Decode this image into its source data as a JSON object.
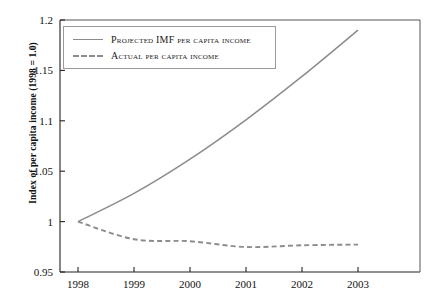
{
  "chart_data": {
    "type": "line",
    "title": "",
    "xlabel": "",
    "ylabel": "Index of per capita income (1998 = 1.0)",
    "x": [
      1998,
      1999,
      2000,
      2001,
      2002,
      2003
    ],
    "xtick_labels": [
      "1998",
      "1999",
      "2000",
      "2001",
      "2002",
      "2003"
    ],
    "xlim": [
      1998,
      2003
    ],
    "ylim": [
      0.95,
      1.2
    ],
    "ytick_labels": [
      "1.2",
      "1.15",
      "1.1",
      "1.05",
      "1",
      "0.95"
    ],
    "ytick_values": [
      1.2,
      1.15,
      1.1,
      1.05,
      1.0,
      0.95
    ],
    "grid": false,
    "legend_position": "top-left",
    "series": [
      {
        "name": "Projected IMF per capita income",
        "style": "solid",
        "color": "#8c8c8c",
        "values": [
          1.0,
          1.028,
          1.062,
          1.101,
          1.144,
          1.19
        ]
      },
      {
        "name": "Actual per capita income",
        "style": "dashed",
        "color": "#8c8c8c",
        "values": [
          1.0,
          0.9825,
          0.9805,
          0.9748,
          0.9765,
          0.9772
        ]
      }
    ]
  },
  "legend": {
    "items": [
      {
        "label": "Projected IMF per capita income"
      },
      {
        "label": "Actual per capita income"
      }
    ]
  },
  "axes": {
    "ylabel": "Index of per capita income (1998 = 1.0)"
  }
}
